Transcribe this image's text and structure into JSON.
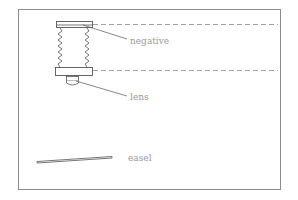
{
  "diagram": {
    "frame": {
      "x": 18,
      "y": 9,
      "width": 263,
      "height": 181,
      "stroke": "#8c8c8c"
    },
    "colors": {
      "line": "#555555",
      "dashed": "#8a8a8a",
      "label": "#9a9a9a"
    },
    "labels": {
      "negative": "negative",
      "lens": "lens",
      "easel": "easel"
    },
    "components": [
      {
        "id": "negative-carrier",
        "label": "negative"
      },
      {
        "id": "bellows"
      },
      {
        "id": "lens-board"
      },
      {
        "id": "lens",
        "label": "lens"
      },
      {
        "id": "easel",
        "label": "easel"
      }
    ]
  }
}
